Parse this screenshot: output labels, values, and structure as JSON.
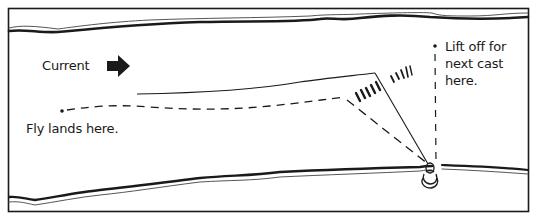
{
  "diagram": {
    "type": "fly-fishing-cast-illustration",
    "labels": {
      "current": "Current",
      "fly_lands": "Fly lands here.",
      "lift_off_line1": "Lift off for",
      "lift_off_line2": "next cast",
      "lift_off_line3": "here."
    },
    "icons": {
      "current_direction": "right-arrow-icon",
      "angler": "angler-icon"
    },
    "colors": {
      "ink": "#1a1a1a",
      "background": "#ffffff",
      "bank_thin": "#555555"
    }
  }
}
